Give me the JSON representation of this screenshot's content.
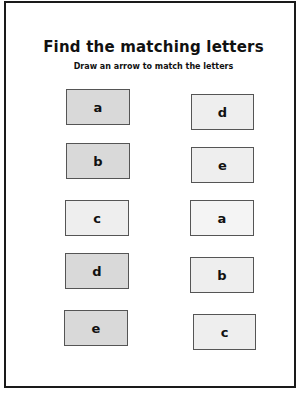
{
  "worksheet": {
    "title": "Find the matching letters",
    "instruction": "Draw an arrow to match the letters",
    "left_column": [
      {
        "letter": "a"
      },
      {
        "letter": "b"
      },
      {
        "letter": "c"
      },
      {
        "letter": "d"
      },
      {
        "letter": "e"
      }
    ],
    "right_column": [
      {
        "letter": "d"
      },
      {
        "letter": "e"
      },
      {
        "letter": "a"
      },
      {
        "letter": "b"
      },
      {
        "letter": "c"
      }
    ]
  }
}
